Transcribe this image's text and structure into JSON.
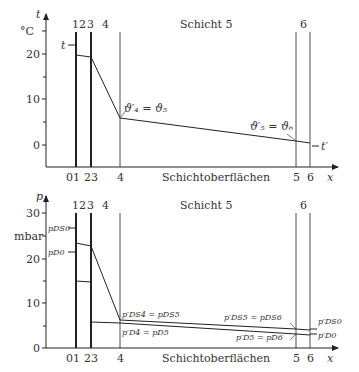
{
  "top_chart": {
    "y_axis_label": "t",
    "y_unit": "°C",
    "y_ticks": [
      {
        "label": "20",
        "y": 54
      },
      {
        "label": "10",
        "y": 99
      },
      {
        "label": "0",
        "y": 145
      }
    ],
    "layer_numbers_top": [
      "1",
      "2",
      "3",
      "4"
    ],
    "layer_title": "Schicht 5",
    "layer_number_6": "6",
    "x_ticks": [
      "01",
      "23",
      "4",
      "5",
      "6"
    ],
    "x_axis_label": "x",
    "x_caption": "Schichtoberflächen",
    "inner_temp_label": "t",
    "outer_temp_label": "t′",
    "annotation_4": "ϑ′₄ = ϑ₅",
    "annotation_5": "ϑ′₅ = ϑ₆"
  },
  "bottom_chart": {
    "y_axis_label": "p",
    "y_unit": "mbar",
    "y_ticks": [
      {
        "label": "30",
        "y": 213
      },
      {
        "label": "20",
        "y": 259
      },
      {
        "label": "10",
        "y": 303
      },
      {
        "label": "0",
        "y": 348
      }
    ],
    "layer_numbers_top": [
      "1",
      "2",
      "3",
      "4"
    ],
    "layer_title": "Schicht 5",
    "layer_number_6": "6",
    "x_ticks": [
      "01",
      "23",
      "4",
      "5",
      "6"
    ],
    "x_axis_label": "x",
    "x_caption": "Schichtoberflächen",
    "pDS0_left": "pDS0",
    "pD0_left": "pD0",
    "annotation_DS4": "p′DS4 = pDS5",
    "annotation_D4": "p′D4 = pD5",
    "annotation_DS5": "p′DS5 = pDS6",
    "annotation_D5": "p′D5 = pD6",
    "pDS0_right": "p′DS0",
    "pD0_right": "p′D0"
  }
}
